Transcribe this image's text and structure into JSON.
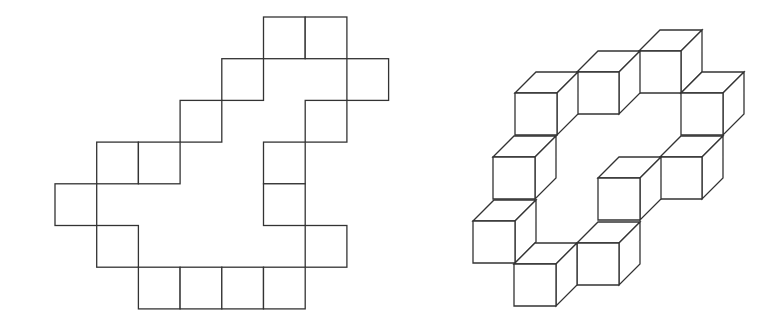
{
  "figure": {
    "stroke_color": "#333333",
    "background": "#ffffff",
    "net": {
      "description": "Flat net of 16 unit squares on a grid",
      "origin": [
        55,
        17
      ],
      "cell": 41.7,
      "cells": [
        [
          5,
          0
        ],
        [
          6,
          0
        ],
        [
          4,
          1
        ],
        [
          7,
          1
        ],
        [
          3,
          2
        ],
        [
          6,
          2
        ],
        [
          1,
          3
        ],
        [
          2,
          3
        ],
        [
          5,
          3
        ],
        [
          0,
          4
        ],
        [
          5,
          4
        ],
        [
          1,
          5
        ],
        [
          6,
          5
        ],
        [
          2,
          6
        ],
        [
          3,
          6
        ],
        [
          4,
          6
        ],
        [
          5,
          6
        ]
      ]
    },
    "cubes": {
      "description": "Isometric arrangement of 10 cubes forming a ring",
      "size": 42,
      "depth": [
        21,
        -21
      ],
      "fronts": [
        [
          639,
          51
        ],
        [
          681,
          93
        ],
        [
          577,
          72
        ],
        [
          515,
          93
        ],
        [
          660,
          157
        ],
        [
          598,
          178
        ],
        [
          493,
          157
        ],
        [
          577,
          243
        ],
        [
          473,
          221
        ],
        [
          514,
          264
        ]
      ]
    }
  }
}
